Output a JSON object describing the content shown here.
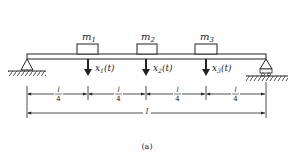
{
  "figure": {
    "caption": "(a)",
    "masses": [
      {
        "label": "m",
        "sub": "1",
        "disp": "x",
        "disp_sub": "1",
        "disp_arg": "(t)"
      },
      {
        "label": "m",
        "sub": "2",
        "disp": "x",
        "disp_sub": "2",
        "disp_arg": "(t)"
      },
      {
        "label": "m",
        "sub": "3",
        "disp": "x",
        "disp_sub": "3",
        "disp_arg": "(t)"
      }
    ],
    "segments": [
      {
        "num": "l",
        "den": "4"
      },
      {
        "num": "l",
        "den": "4"
      },
      {
        "num": "l",
        "den": "4"
      },
      {
        "num": "l",
        "den": "4"
      }
    ],
    "total_length": "l",
    "supports": {
      "left": "pinned-support",
      "right": "roller-support"
    },
    "colors": {
      "ink": "#222222",
      "background": "#ffffff"
    }
  }
}
